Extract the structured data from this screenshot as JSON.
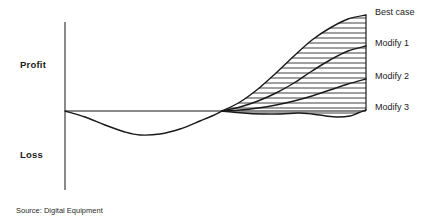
{
  "figure": {
    "background_color": "#ffffff",
    "width": 446,
    "height": 222
  },
  "axes": {
    "y_axis_upper_label": "Profit",
    "y_axis_lower_label": "Loss",
    "axis_color": "#8a8a8a",
    "curve_color": "#1a1a1a",
    "hatch_color": "#2b2b2b"
  },
  "series_labels": [
    {
      "label": "Best case",
      "top": 7
    },
    {
      "label": "Modify 1",
      "top": 38
    },
    {
      "label": "Modify 2",
      "top": 71
    },
    {
      "label": "Modify 3",
      "top": 102
    }
  ],
  "source": {
    "text": "Source: Digital Equipment"
  },
  "chart_data": {
    "type": "line",
    "title": "",
    "subtitle": "",
    "xlabel": "Time",
    "ylabel": "Profit / Loss",
    "grid": false,
    "legend_position": "right-inline",
    "annotations": [
      "Profit",
      "Loss",
      "Source: Digital Equipment"
    ],
    "axis_pixels": {
      "y_axis_x": 65,
      "y_axis_top": 22,
      "y_axis_bottom": 190,
      "zero_line_y": 111,
      "zero_line_x_start": 65,
      "zero_line_x_end": 366,
      "divergence_x": 222,
      "right_boundary_x": 366
    },
    "shared_x_note": "x is time in pixel coordinates from the y-axis (65) to the right boundary (366)",
    "common_trunk": {
      "name": "Investment / loss phase",
      "points": [
        [
          65,
          111
        ],
        [
          85,
          117
        ],
        [
          105,
          125
        ],
        [
          125,
          132
        ],
        [
          140,
          135
        ],
        [
          160,
          134
        ],
        [
          180,
          129
        ],
        [
          200,
          121
        ],
        [
          212,
          116
        ],
        [
          222,
          111
        ]
      ],
      "min_value_y": 135,
      "min_value_x": 140,
      "zero_crossing_x": 222
    },
    "series": [
      {
        "name": "Best case",
        "end_y": 15,
        "end_x": 366,
        "points": [
          [
            222,
            111
          ],
          [
            240,
            102
          ],
          [
            258,
            89
          ],
          [
            276,
            73
          ],
          [
            294,
            56
          ],
          [
            312,
            40
          ],
          [
            330,
            28
          ],
          [
            348,
            19
          ],
          [
            366,
            15
          ]
        ]
      },
      {
        "name": "Modify 1",
        "end_y": 46,
        "end_x": 366,
        "points": [
          [
            222,
            111
          ],
          [
            240,
            107
          ],
          [
            258,
            101
          ],
          [
            276,
            93
          ],
          [
            294,
            83
          ],
          [
            312,
            71
          ],
          [
            330,
            60
          ],
          [
            348,
            51
          ],
          [
            366,
            46
          ]
        ]
      },
      {
        "name": "Modify 2",
        "end_y": 79,
        "end_x": 366,
        "points": [
          [
            222,
            111
          ],
          [
            240,
            110
          ],
          [
            258,
            108
          ],
          [
            276,
            105
          ],
          [
            294,
            101
          ],
          [
            312,
            96
          ],
          [
            330,
            90
          ],
          [
            348,
            84
          ],
          [
            366,
            79
          ]
        ]
      },
      {
        "name": "Modify 3",
        "end_y": 110,
        "end_x": 366,
        "points": [
          [
            222,
            111
          ],
          [
            243,
            113
          ],
          [
            262,
            114
          ],
          [
            281,
            114
          ],
          [
            298,
            113
          ],
          [
            312,
            114
          ],
          [
            326,
            116
          ],
          [
            338,
            117
          ],
          [
            350,
            116
          ],
          [
            358,
            113
          ],
          [
            366,
            110
          ]
        ]
      }
    ],
    "hatching": {
      "style": "horizontal-lines",
      "spacing_px": 5,
      "region": "between Best case (upper bound) and Modify 3 (lower bound)"
    }
  }
}
